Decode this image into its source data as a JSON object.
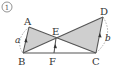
{
  "problem_number": "①",
  "points": {
    "A": {
      "label": "A",
      "x": 29,
      "y": 27
    },
    "B": {
      "label": "B",
      "x": 23,
      "y": 53
    },
    "C": {
      "label": "C",
      "x": 96,
      "y": 53
    },
    "D": {
      "label": "D",
      "x": 103,
      "y": 17
    },
    "E": {
      "label": "E",
      "x": 56,
      "y": 38
    },
    "F": {
      "label": "F",
      "x": 54,
      "y": 53
    }
  },
  "side_labels": {
    "a": "a",
    "b": "b"
  },
  "colors": {
    "fill": "#cfcfcf",
    "line": "#555555",
    "dashed": "#888888"
  }
}
